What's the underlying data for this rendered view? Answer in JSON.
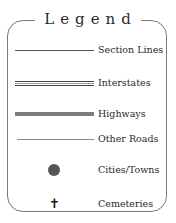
{
  "legend": {
    "title": "Legend",
    "items": [
      {
        "label": "Section Lines",
        "symbol": "thin-line"
      },
      {
        "label": "Interstates",
        "symbol": "double-line"
      },
      {
        "label": "Highways",
        "symbol": "thick-gray-line"
      },
      {
        "label": "Other Roads",
        "symbol": "thin-gray-line"
      },
      {
        "label": "Cities/Towns",
        "symbol": "filled-circle"
      },
      {
        "label": "Cemeteries",
        "symbol": "cross",
        "glyph": "✝"
      }
    ],
    "colors": {
      "border": "#7a7a7a",
      "text": "#2a2a2a",
      "highway": "#7c7c7c",
      "city_dot": "#555555"
    }
  }
}
